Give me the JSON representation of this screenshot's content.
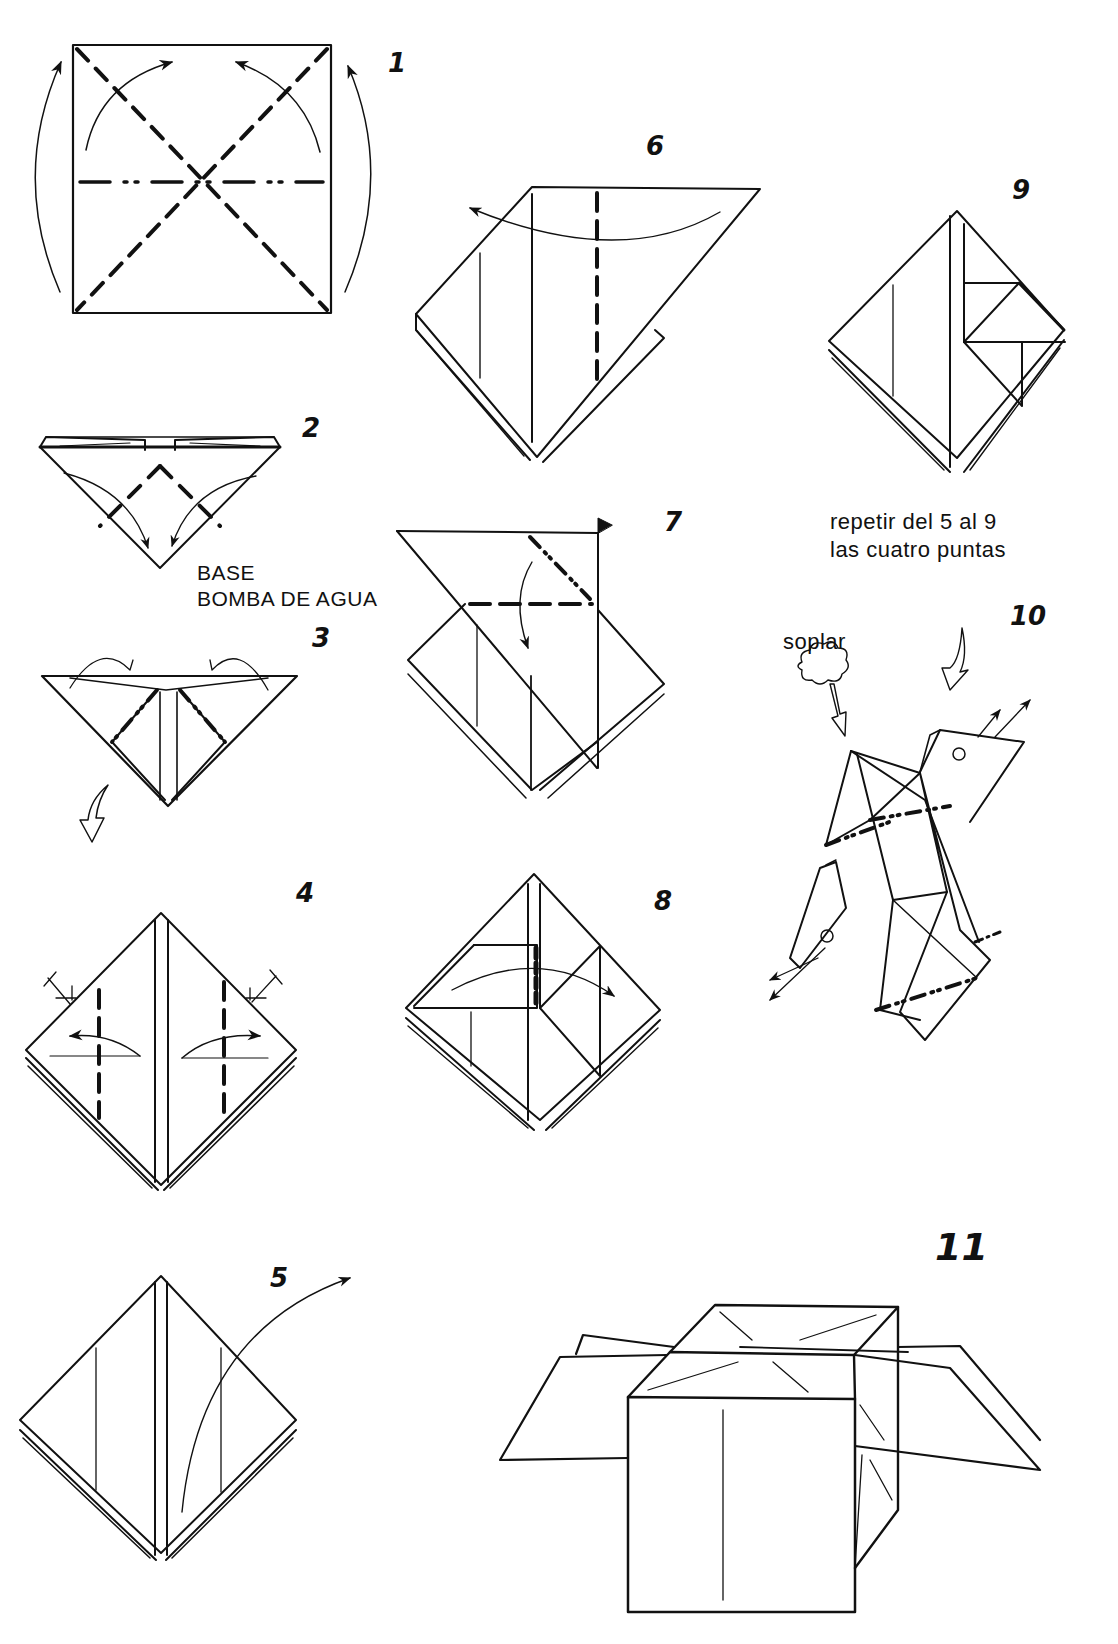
{
  "document": {
    "kind": "origami-diagram-sheet",
    "ink_color": "#111111",
    "paper_color": "#ffffff"
  },
  "steps": [
    {
      "number": "1"
    },
    {
      "number": "2"
    },
    {
      "number": "3"
    },
    {
      "number": "4"
    },
    {
      "number": "5"
    },
    {
      "number": "6"
    },
    {
      "number": "7"
    },
    {
      "number": "8"
    },
    {
      "number": "9"
    },
    {
      "number": "10"
    },
    {
      "number": "11"
    }
  ],
  "captions": {
    "base_label": {
      "line1": "BASE",
      "line2": "BOMBA DE AGUA"
    },
    "repeat_note": {
      "line1": "repetir del 5 al 9",
      "line2": "las cuatro puntas"
    },
    "blow_label": "soplar"
  },
  "icons": {
    "valley_fold": "dashed-line",
    "mountain_fold": "dash-dot-line",
    "fold_arrow": "curved-arrow",
    "turn_over_arrow": "hollow-arrow",
    "blow_cloud": "cloud-icon"
  }
}
